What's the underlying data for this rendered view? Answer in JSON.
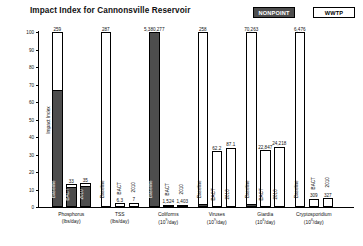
{
  "title": "Impact Index for Cannonsville Reservoir",
  "legend": {
    "position": "top-right",
    "entries": [
      {
        "label": "NONPOINT",
        "color": "#4d4d4d",
        "style": "filled"
      },
      {
        "label": "WWTP",
        "color": "#ffffff",
        "style": "outline"
      }
    ]
  },
  "axes": {
    "ylabel": "Impact Index",
    "yticks": [
      "0",
      "10",
      "20",
      "30",
      "40",
      "50",
      "60",
      "70",
      "80",
      "90",
      "100"
    ],
    "ymin": 0,
    "ymax": 100
  },
  "chart_data": {
    "type": "bar",
    "title": "Impact Index for Cannonsville Reservoir",
    "xlabel": "",
    "ylabel": "Impact Index",
    "ylim": [
      0,
      100
    ],
    "grid": false,
    "legend_position": "top-right",
    "series": [
      {
        "name": "NONPOINT",
        "color": "#4d4d4d"
      },
      {
        "name": "WWTP",
        "color": "#ffffff"
      }
    ],
    "categories": [
      {
        "name": "Phosphorus",
        "unit": "(lbs/day)",
        "unit_base": "",
        "unit_exp": ""
      },
      {
        "name": "TSS",
        "unit": "(lbs/day)",
        "unit_base": "",
        "unit_exp": ""
      },
      {
        "name": "Coliforms",
        "unit": "(10^9/day)",
        "unit_base": "(10",
        "unit_exp": "9"
      },
      {
        "name": "Viruses",
        "unit": "(10^9/day)",
        "unit_base": "(10",
        "unit_exp": "9"
      },
      {
        "name": "Giardia",
        "unit": "(10^6/day)",
        "unit_base": "(10",
        "unit_exp": "6"
      },
      {
        "name": "Cryptosporidium",
        "unit": "(10^6/day)",
        "unit_base": "(10",
        "unit_exp": "6"
      }
    ],
    "scenarios": [
      "Baseline",
      "BACT",
      "2010"
    ],
    "bars": [
      {
        "category": "Phosphorus",
        "scenario": "Baseline",
        "value_label": "259",
        "index": 100,
        "nonpoint_index": 67,
        "wwtp_index": 33
      },
      {
        "category": "Phosphorus",
        "scenario": "BACT",
        "value_label": "33",
        "index": 13,
        "nonpoint_index": 11.5,
        "wwtp_index": 1.5
      },
      {
        "category": "Phosphorus",
        "scenario": "2010",
        "value_label": "35",
        "index": 13.6,
        "nonpoint_index": 12,
        "wwtp_index": 1.6
      },
      {
        "category": "TSS",
        "scenario": "Baseline",
        "value_label": "287",
        "index": 100,
        "nonpoint_index": 0,
        "wwtp_index": 100
      },
      {
        "category": "TSS",
        "scenario": "BACT",
        "value_label": "6.3",
        "index": 2.2,
        "nonpoint_index": 0,
        "wwtp_index": 2.2
      },
      {
        "category": "TSS",
        "scenario": "2010",
        "value_label": "7",
        "index": 2.4,
        "nonpoint_index": 0,
        "wwtp_index": 2.4
      },
      {
        "category": "Coliforms",
        "scenario": "Baseline",
        "value_label": "5,380,277",
        "index": 100,
        "nonpoint_index": 100,
        "wwtp_index": 0
      },
      {
        "category": "Coliforms",
        "scenario": "BACT",
        "value_label": "1,524",
        "index": 0.5,
        "nonpoint_index": 0.5,
        "wwtp_index": 0
      },
      {
        "category": "Coliforms",
        "scenario": "2010",
        "value_label": "1,403",
        "index": 0.5,
        "nonpoint_index": 0.5,
        "wwtp_index": 0
      },
      {
        "category": "Viruses",
        "scenario": "Baseline",
        "value_label": "258",
        "index": 100,
        "nonpoint_index": 2,
        "wwtp_index": 98
      },
      {
        "category": "Viruses",
        "scenario": "BACT",
        "value_label": "62.2",
        "index": 32,
        "nonpoint_index": 0,
        "wwtp_index": 32
      },
      {
        "category": "Viruses",
        "scenario": "2010",
        "value_label": "87.1",
        "index": 34,
        "nonpoint_index": 0,
        "wwtp_index": 34
      },
      {
        "category": "Giardia",
        "scenario": "Baseline",
        "value_label": "70,263",
        "index": 100,
        "nonpoint_index": 1.5,
        "wwtp_index": 98.5
      },
      {
        "category": "Giardia",
        "scenario": "BACT",
        "value_label": "22,847",
        "index": 32.5,
        "nonpoint_index": 0,
        "wwtp_index": 32.5
      },
      {
        "category": "Giardia",
        "scenario": "2010",
        "value_label": "24,218",
        "index": 34.5,
        "nonpoint_index": 0,
        "wwtp_index": 34.5
      },
      {
        "category": "Cryptosporidium",
        "scenario": "Baseline",
        "value_label": "6,476",
        "index": 100,
        "nonpoint_index": 0,
        "wwtp_index": 100
      },
      {
        "category": "Cryptosporidium",
        "scenario": "BACT",
        "value_label": "309",
        "index": 4.8,
        "nonpoint_index": 0,
        "wwtp_index": 4.8
      },
      {
        "category": "Cryptosporidium",
        "scenario": "2010",
        "value_label": "327",
        "index": 5.1,
        "nonpoint_index": 0,
        "wwtp_index": 5.1
      }
    ]
  }
}
